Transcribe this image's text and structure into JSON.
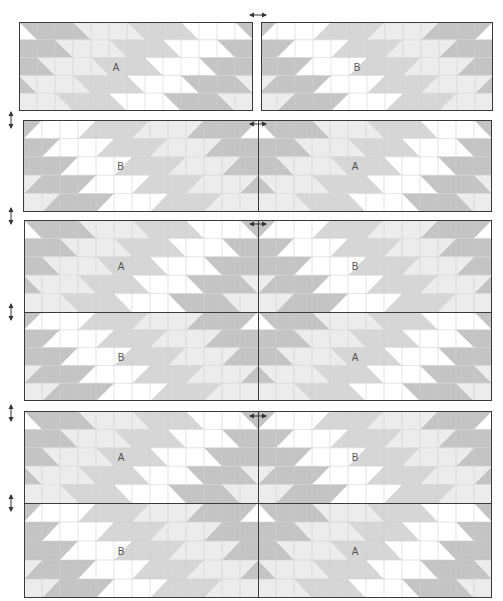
{
  "colors": {
    "dark": "#c4c4c4",
    "mid": "#d6d6d6",
    "light": "#ececec",
    "white": "#ffffff",
    "grid": "#d2d2d2",
    "border": "#3a3a3a",
    "label": "#555555"
  },
  "cell": 18,
  "panels": [
    {
      "name": "row-1",
      "blocks": [
        {
          "label": "A",
          "type": "A",
          "x": 19,
          "y": 22,
          "w": 234,
          "h": 89
        },
        {
          "label": "B",
          "type": "B",
          "x": 261,
          "y": 22,
          "w": 232,
          "h": 89
        }
      ],
      "borders": [
        {
          "x": 19,
          "y": 22,
          "w": 234,
          "h": 89
        },
        {
          "x": 261,
          "y": 22,
          "w": 232,
          "h": 89
        }
      ]
    },
    {
      "name": "row-2",
      "blocks": [
        {
          "label": "B",
          "type": "B",
          "x": 23,
          "y": 120,
          "w": 235,
          "h": 92
        },
        {
          "label": "A",
          "type": "A",
          "x": 258,
          "y": 120,
          "w": 234,
          "h": 92
        }
      ],
      "borders": [
        {
          "x": 23,
          "y": 120,
          "w": 469,
          "h": 92
        }
      ],
      "vlines": [
        {
          "x": 258,
          "y": 120,
          "h": 92
        }
      ]
    },
    {
      "name": "row-3",
      "blocks": [
        {
          "label": "A",
          "type": "A",
          "x": 24,
          "y": 220,
          "w": 234,
          "h": 92
        },
        {
          "label": "B",
          "type": "B",
          "x": 258,
          "y": 220,
          "w": 234,
          "h": 92
        },
        {
          "label": "B",
          "type": "B",
          "x": 24,
          "y": 312,
          "w": 234,
          "h": 89
        },
        {
          "label": "A",
          "type": "A",
          "x": 258,
          "y": 312,
          "w": 234,
          "h": 89
        }
      ],
      "borders": [
        {
          "x": 24,
          "y": 220,
          "w": 468,
          "h": 181
        }
      ],
      "vlines": [
        {
          "x": 258,
          "y": 220,
          "h": 181
        }
      ],
      "hlines": [
        {
          "x": 24,
          "y": 312,
          "w": 468
        }
      ]
    },
    {
      "name": "row-4",
      "blocks": [
        {
          "label": "A",
          "type": "A",
          "x": 24,
          "y": 411,
          "w": 234,
          "h": 92
        },
        {
          "label": "B",
          "type": "B",
          "x": 258,
          "y": 411,
          "w": 234,
          "h": 92
        },
        {
          "label": "B",
          "type": "B",
          "x": 24,
          "y": 503,
          "w": 234,
          "h": 95
        },
        {
          "label": "A",
          "type": "A",
          "x": 258,
          "y": 503,
          "w": 234,
          "h": 95
        }
      ],
      "borders": [
        {
          "x": 24,
          "y": 411,
          "w": 468,
          "h": 187
        }
      ],
      "vlines": [
        {
          "x": 258,
          "y": 411,
          "h": 187
        }
      ],
      "hlines": [
        {
          "x": 24,
          "y": 503,
          "w": 468
        }
      ]
    }
  ],
  "arrows": {
    "horizontal": [
      {
        "x": 249,
        "y": 4
      },
      {
        "x": 249,
        "y": 113
      },
      {
        "x": 249,
        "y": 213
      },
      {
        "x": 249,
        "y": 405
      }
    ],
    "vertical": [
      {
        "x": 8,
        "y": 111
      },
      {
        "x": 8,
        "y": 207
      },
      {
        "x": 8,
        "y": 303
      },
      {
        "x": 8,
        "y": 404
      },
      {
        "x": 8,
        "y": 494
      }
    ]
  }
}
